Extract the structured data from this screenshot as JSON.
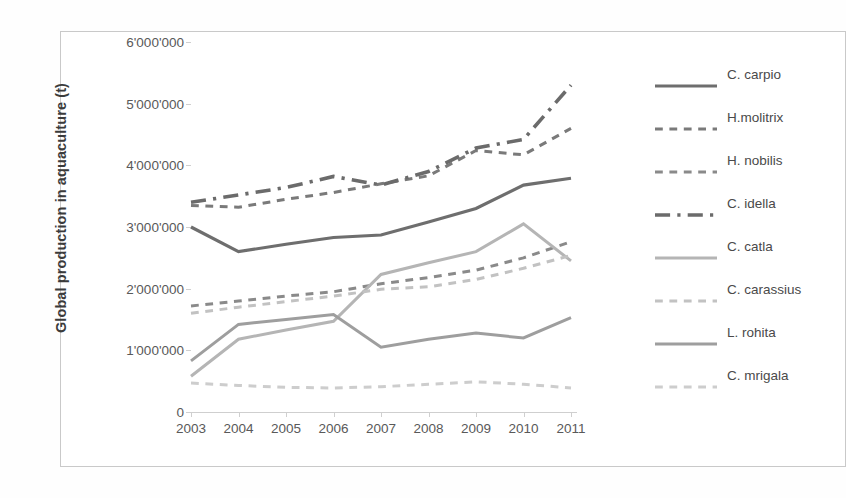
{
  "axis": {
    "y_title": "Global production in aquaculture (t)",
    "y_ticks": [
      "0",
      "1'000'000",
      "2'000'000",
      "3'000'000",
      "4'000'000",
      "5'000'000",
      "6'000'000"
    ],
    "x_ticks": [
      "2003",
      "2004",
      "2005",
      "2006",
      "2007",
      "2008",
      "2009",
      "2010",
      "2011"
    ]
  },
  "legend": {
    "items": [
      {
        "label": "C. carpio"
      },
      {
        "label": "H.molitrix"
      },
      {
        "label": "H. nobilis"
      },
      {
        "label": "C. idella"
      },
      {
        "label": "C. catla"
      },
      {
        "label": "C. carassius"
      },
      {
        "label": "L. rohita"
      },
      {
        "label": "C. mrigala"
      }
    ]
  },
  "chart_data": {
    "type": "line",
    "title": "",
    "xlabel": "",
    "ylabel": "Global production in aquaculture (t)",
    "x": [
      2003,
      2004,
      2005,
      2006,
      2007,
      2008,
      2009,
      2010,
      2011
    ],
    "categories": [
      "2003",
      "2004",
      "2005",
      "2006",
      "2007",
      "2008",
      "2009",
      "2010",
      "2011"
    ],
    "xlim": [
      2003,
      2011
    ],
    "ylim": [
      0,
      6000000
    ],
    "ytick_values": [
      0,
      1000000,
      2000000,
      3000000,
      4000000,
      5000000,
      6000000
    ],
    "grid": false,
    "legend_position": "right",
    "series": [
      {
        "name": "C. carpio",
        "color": "#6e6e6e",
        "style": "solid",
        "width": 3.2,
        "values": [
          3000000,
          2600000,
          2720000,
          2830000,
          2870000,
          3080000,
          3300000,
          3680000,
          3790000
        ]
      },
      {
        "name": "H.molitrix",
        "color": "#7a7a7a",
        "style": "dashed",
        "width": 3.0,
        "values": [
          3350000,
          3320000,
          3450000,
          3560000,
          3700000,
          3830000,
          4240000,
          4170000,
          4600000
        ]
      },
      {
        "name": "H. nobilis",
        "color": "#8a8a8a",
        "style": "dashed",
        "width": 3.0,
        "values": [
          1720000,
          1800000,
          1880000,
          1950000,
          2080000,
          2180000,
          2300000,
          2500000,
          2760000
        ]
      },
      {
        "name": "C. idella",
        "color": "#6b6b6b",
        "style": "dashdot",
        "width": 3.6,
        "values": [
          3400000,
          3520000,
          3640000,
          3820000,
          3680000,
          3900000,
          4280000,
          4420000,
          5300000
        ]
      },
      {
        "name": "C. catla",
        "color": "#b5b5b5",
        "style": "solid",
        "width": 3.0,
        "values": [
          580000,
          1180000,
          1330000,
          1470000,
          2230000,
          2420000,
          2600000,
          3050000,
          2450000
        ]
      },
      {
        "name": "C. carassius",
        "color": "#c2c2c2",
        "style": "dashed",
        "width": 3.0,
        "values": [
          1600000,
          1700000,
          1790000,
          1880000,
          1990000,
          2030000,
          2150000,
          2330000,
          2540000
        ]
      },
      {
        "name": "L. rohita",
        "color": "#9e9e9e",
        "style": "solid",
        "width": 3.0,
        "values": [
          830000,
          1420000,
          1500000,
          1580000,
          1050000,
          1180000,
          1280000,
          1200000,
          1530000
        ]
      },
      {
        "name": "C. mrigala",
        "color": "#cdcdcd",
        "style": "dashed",
        "width": 3.0,
        "values": [
          470000,
          430000,
          400000,
          390000,
          410000,
          450000,
          490000,
          450000,
          390000
        ]
      }
    ]
  }
}
